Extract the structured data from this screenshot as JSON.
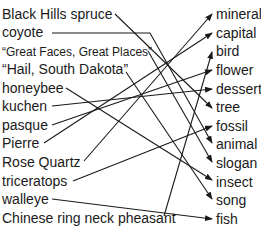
{
  "left_items": [
    {
      "label": "Black Hills spruce",
      "y": 6,
      "small": false
    },
    {
      "label": "coyote",
      "y": 24,
      "small": false
    },
    {
      "label": "“Great Faces, Great Places”",
      "y": 43,
      "small": true
    },
    {
      "label": "“Hail, South Dakota”",
      "y": 61,
      "small": false
    },
    {
      "label": "honeybee",
      "y": 80,
      "small": false
    },
    {
      "label": "kuchen",
      "y": 98,
      "small": false
    },
    {
      "label": "pasque",
      "y": 117,
      "small": false
    },
    {
      "label": "Pierre",
      "y": 135,
      "small": false
    },
    {
      "label": "Rose Quartz",
      "y": 154,
      "small": false
    },
    {
      "label": "triceratops",
      "y": 173,
      "small": false
    },
    {
      "label": "walleye",
      "y": 191,
      "small": false
    },
    {
      "label": "Chinese ring neck pheasant",
      "y": 210,
      "small": false
    }
  ],
  "right_items": [
    {
      "label": "mineral",
      "y": 6
    },
    {
      "label": "capital",
      "y": 25
    },
    {
      "label": "bird",
      "y": 43
    },
    {
      "label": "flower",
      "y": 62
    },
    {
      "label": "dessert",
      "y": 81
    },
    {
      "label": "tree",
      "y": 99
    },
    {
      "label": "fossil",
      "y": 118
    },
    {
      "label": "animal",
      "y": 136
    },
    {
      "label": "slogan",
      "y": 155
    },
    {
      "label": "insect",
      "y": 174
    },
    {
      "label": "song",
      "y": 192
    },
    {
      "label": "fish",
      "y": 211
    }
  ],
  "connections": [
    {
      "from": "Black Hills spruce",
      "to": "tree",
      "x1": 115,
      "y1": 14,
      "x2": 212,
      "y2": 108
    },
    {
      "from": "coyote",
      "to": "animal",
      "x1": 52,
      "y1": 33,
      "x2": 150,
      "y2": 33,
      "x3": 212,
      "y3": 143
    },
    {
      "from": "“Great Faces, Great Places”",
      "to": "slogan",
      "x1": 148,
      "y1": 51,
      "x2": 212,
      "y2": 162
    },
    {
      "from": "“Hail, South Dakota”",
      "to": "song",
      "x1": 126,
      "y1": 72,
      "x2": 212,
      "y2": 199
    },
    {
      "from": "honeybee",
      "to": "insect",
      "x1": 66,
      "y1": 88,
      "x2": 212,
      "y2": 180
    },
    {
      "from": "kuchen",
      "to": "dessert",
      "x1": 52,
      "y1": 106,
      "x2": 212,
      "y2": 89
    },
    {
      "from": "pasque",
      "to": "flower",
      "x1": 52,
      "y1": 125,
      "x2": 212,
      "y2": 70
    },
    {
      "from": "Pierre",
      "to": "capital",
      "x1": 44,
      "y1": 143,
      "x2": 212,
      "y2": 33
    },
    {
      "from": "Rose Quartz",
      "to": "mineral",
      "x1": 84,
      "y1": 161,
      "x2": 212,
      "y2": 14
    },
    {
      "from": "triceratops",
      "to": "fossil",
      "x1": 73,
      "y1": 181,
      "x2": 212,
      "y2": 126
    },
    {
      "from": "walleye",
      "to": "fish",
      "x1": 52,
      "y1": 199,
      "x2": 212,
      "y2": 219
    },
    {
      "from": "Chinese ring neck pheasant",
      "to": "bird",
      "x1": 164,
      "y1": 216,
      "x2": 212,
      "y2": 52
    }
  ],
  "colors": {
    "line": "#1a1a1a",
    "text": "#1a1a1a",
    "background": "#ffffff"
  }
}
